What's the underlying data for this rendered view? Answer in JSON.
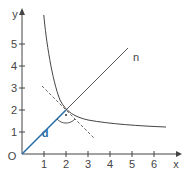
{
  "diagram": {
    "axes": {
      "x_label": "x",
      "y_label": "y",
      "origin_label": "O",
      "x_ticks": [
        "1",
        "2",
        "3",
        "4",
        "5",
        "6"
      ],
      "y_ticks": [
        "1",
        "2",
        "3",
        "4",
        "5"
      ]
    },
    "curve": {
      "label": "",
      "equation": "y = 1/(x-1) + 1"
    },
    "line_n": {
      "label": "n",
      "equation": "y = x"
    },
    "tangent": {
      "style": "dashed",
      "equation": "y = -x + 4"
    },
    "segment_d": {
      "label": "d",
      "from": [
        0,
        0
      ],
      "to": [
        2,
        2
      ]
    },
    "intersection": {
      "point": [
        2,
        2
      ],
      "right_angle_marker": true
    },
    "colors": {
      "axis": "#444444",
      "curve": "#444444",
      "segment_d": "#2a6fa8",
      "tangent": "#666666"
    }
  }
}
